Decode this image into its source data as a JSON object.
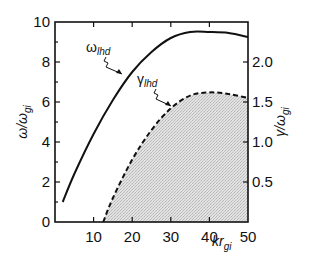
{
  "chart_data": {
    "type": "line",
    "title": "",
    "xlabel": "kr_gi",
    "ylabel_left": "ω/ω_gi",
    "ylabel_right": "γ/ω_gi",
    "xlim": [
      0,
      50
    ],
    "ylim_left": [
      0,
      10
    ],
    "ylim_right": [
      0,
      2.5
    ],
    "x_ticks": [
      10,
      20,
      30,
      40,
      50
    ],
    "x_tick_labels": [
      "10",
      "20",
      "30",
      "40",
      "50"
    ],
    "y_left_ticks": [
      0,
      2,
      4,
      6,
      8,
      10
    ],
    "y_left_tick_labels": [
      "0",
      "2",
      "4",
      "6",
      "8",
      "10"
    ],
    "y_right_ticks": [
      0.5,
      1.0,
      1.5,
      2.0
    ],
    "y_right_tick_labels": [
      "0.5",
      "1.0",
      "1.5",
      "2.0"
    ],
    "grid": false,
    "legend": "inline annotations with arrows",
    "series": [
      {
        "name": "ω_lhd",
        "label_main": "ω",
        "label_sub": "lhd",
        "axis": "left",
        "style": "solid",
        "x": [
          2,
          5,
          10,
          15,
          20,
          25,
          30,
          35,
          40,
          45,
          50
        ],
        "values": [
          1.0,
          2.4,
          4.4,
          6.1,
          7.5,
          8.5,
          9.2,
          9.5,
          9.5,
          9.45,
          9.25
        ]
      },
      {
        "name": "γ_lhd",
        "label_main": "γ",
        "label_sub": "lhd",
        "axis": "right",
        "style": "dashed",
        "fill": "stippled gray under curve",
        "x": [
          12.5,
          15,
          20,
          25,
          30,
          35,
          40,
          45,
          50
        ],
        "values": [
          0.0,
          0.3,
          0.78,
          1.15,
          1.42,
          1.58,
          1.62,
          1.6,
          1.55
        ]
      }
    ]
  },
  "labels": {
    "x_axis_main": "kr",
    "x_axis_sub": "gi",
    "y_left_main": "ω/ω",
    "y_left_sub": "gi",
    "y_right_main": "γ/ω",
    "y_right_sub": "gi",
    "omega_main": "ω",
    "omega_sub": "lhd",
    "gamma_main": "γ",
    "gamma_sub": "lhd"
  },
  "colors": {
    "line": "#111111",
    "fill": "#d9d9d9",
    "background": "#ffffff"
  }
}
